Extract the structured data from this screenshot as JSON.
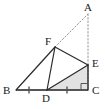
{
  "figure": {
    "type": "geometry-diagram",
    "background_color": "#ffffff",
    "stroke_color": "#2b2b2b",
    "dotted_color": "#9a9a9a",
    "shade_color": "#e2e2e2",
    "width": 105,
    "height": 109,
    "points": {
      "A": {
        "label": "A",
        "x": 88,
        "y": 14,
        "label_x": 84,
        "label_y": 2
      },
      "B": {
        "label": "B",
        "x": 16,
        "y": 90,
        "label_x": 3,
        "label_y": 85
      },
      "C": {
        "label": "C",
        "x": 88,
        "y": 90,
        "label_x": 92,
        "label_y": 85
      },
      "D": {
        "label": "D",
        "x": 47,
        "y": 90,
        "label_x": 42,
        "label_y": 93
      },
      "E": {
        "label": "E",
        "x": 88,
        "y": 65,
        "label_x": 92,
        "label_y": 58
      },
      "F": {
        "label": "F",
        "x": 55,
        "y": 47,
        "label_x": 45,
        "label_y": 36
      }
    },
    "solid_segments": [
      {
        "name": "segment-BF",
        "from": "B",
        "to": "F"
      },
      {
        "name": "segment-BD",
        "from": "B",
        "to": "D"
      },
      {
        "name": "segment-DC",
        "from": "D",
        "to": "C"
      },
      {
        "name": "segment-FD",
        "from": "F",
        "to": "D"
      },
      {
        "name": "segment-FE",
        "from": "F",
        "to": "E"
      },
      {
        "name": "segment-DE",
        "from": "D",
        "to": "E"
      },
      {
        "name": "segment-EC",
        "from": "E",
        "to": "C"
      }
    ],
    "dotted_segments": [
      {
        "name": "segment-FA",
        "from": "F",
        "to": "A"
      },
      {
        "name": "segment-AC",
        "from": "A",
        "to": "C"
      }
    ],
    "shaded_regions": [
      {
        "name": "triangle-DEC",
        "vertices": [
          "D",
          "E",
          "C"
        ]
      }
    ],
    "tick_marks": [
      {
        "name": "tick-BD",
        "x": 29,
        "y": 90
      },
      {
        "name": "tick-DC",
        "x": 67,
        "y": 90
      }
    ],
    "right_angle": {
      "name": "right-angle-C",
      "x": 88,
      "y": 90,
      "size": 7
    }
  }
}
